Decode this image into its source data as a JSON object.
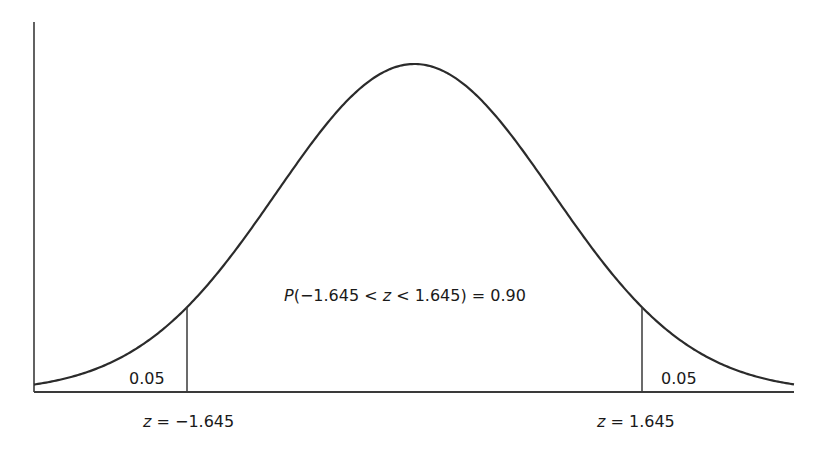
{
  "chart_data": {
    "type": "area",
    "title": "",
    "distribution": "standard normal",
    "xlabel": "",
    "ylabel": "",
    "mean": 0,
    "std": 1,
    "xlim": [
      -2.75,
      2.75
    ],
    "grid": false,
    "legend": null,
    "critical_values": [
      -1.645,
      1.645
    ],
    "regions": [
      {
        "name": "left-tail",
        "from": null,
        "to": -1.645,
        "area": 0.05,
        "label": "0.05"
      },
      {
        "name": "center",
        "from": -1.645,
        "to": 1.645,
        "area": 0.9
      },
      {
        "name": "right-tail",
        "from": 1.645,
        "to": null,
        "area": 0.05,
        "label": "0.05"
      }
    ],
    "annotations": [
      {
        "text": "P(−1.645 < z < 1.645) = 0.90",
        "position": "center"
      },
      {
        "text": "z = −1.645",
        "position": "below left cutoff"
      },
      {
        "text": "z = 1.645",
        "position": "below right cutoff"
      }
    ]
  },
  "labels": {
    "left_tail_area": "0.05",
    "right_tail_area": "0.05",
    "prob_P": "P",
    "prob_open": "(−1.645 < ",
    "prob_z": "z",
    "prob_close": " < 1.645) = 0.90",
    "left_z": "z",
    "left_z_value": " = −1.645",
    "right_z": "z",
    "right_z_value": " = 1.645"
  },
  "colors": {
    "line": "#2b2b2b",
    "axis": "#3a3a3a",
    "background": "#ffffff"
  }
}
